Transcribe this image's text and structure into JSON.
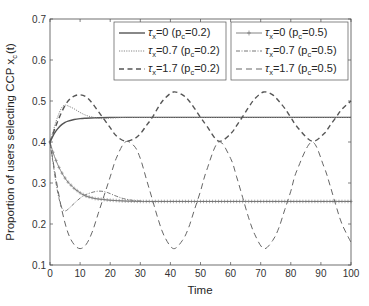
{
  "chart_data": {
    "type": "line",
    "title": "",
    "xlabel": "Time",
    "ylabel": "Proportion of users selecting CCP x",
    "ylabel_subscript": "c",
    "ylabel_suffix": "(t)",
    "xlim": [
      0,
      100
    ],
    "ylim": [
      0.1,
      0.7
    ],
    "x_ticks": [
      0,
      10,
      20,
      30,
      40,
      50,
      60,
      70,
      80,
      90,
      100
    ],
    "y_ticks": [
      0.1,
      0.2,
      0.3,
      0.4,
      0.5,
      0.6,
      0.7
    ],
    "grid": false,
    "legend_position": "top, two boxes (left: p_c=0.2, right: p_c=0.5)",
    "series": [
      {
        "name": "τx=0 (pc=0.2)",
        "style": "solid",
        "x": [
          0,
          1,
          2,
          3,
          4,
          5,
          6,
          8,
          10,
          12,
          15,
          20,
          30,
          50,
          100
        ],
        "values": [
          0.4,
          0.415,
          0.427,
          0.436,
          0.443,
          0.448,
          0.451,
          0.455,
          0.457,
          0.458,
          0.459,
          0.46,
          0.46,
          0.46,
          0.46
        ]
      },
      {
        "name": "τx=0.7 (pc=0.2)",
        "style": "dotted",
        "x": [
          0,
          1,
          2,
          3,
          4,
          5,
          6,
          8,
          10,
          12,
          14,
          17,
          20,
          25,
          30,
          50,
          100
        ],
        "values": [
          0.4,
          0.425,
          0.45,
          0.47,
          0.485,
          0.49,
          0.488,
          0.481,
          0.472,
          0.465,
          0.461,
          0.457,
          0.458,
          0.46,
          0.46,
          0.46,
          0.46
        ]
      },
      {
        "name": "τx=1.7 (pc=0.2)",
        "style": "dashed",
        "x": [
          0,
          2,
          4,
          6,
          8,
          10,
          12,
          14,
          16,
          18,
          20,
          22,
          25,
          28,
          30,
          32,
          34,
          36,
          38,
          41,
          44,
          46,
          48,
          50,
          52,
          56,
          60,
          62,
          64,
          66,
          68,
          71,
          74,
          76,
          78,
          80,
          82,
          87,
          91,
          93,
          95,
          97,
          100
        ],
        "values": [
          0.4,
          0.44,
          0.475,
          0.5,
          0.512,
          0.515,
          0.51,
          0.495,
          0.475,
          0.455,
          0.435,
          0.415,
          0.402,
          0.408,
          0.42,
          0.44,
          0.46,
          0.485,
          0.505,
          0.522,
          0.515,
          0.502,
          0.482,
          0.46,
          0.44,
          0.402,
          0.42,
          0.44,
          0.462,
          0.485,
          0.505,
          0.522,
          0.515,
          0.5,
          0.482,
          0.46,
          0.438,
          0.402,
          0.42,
          0.44,
          0.46,
          0.48,
          0.5
        ]
      },
      {
        "name": "τx=0 (pc=0.5)",
        "style": "solid with plus markers",
        "x": [
          0,
          1,
          2,
          3,
          4,
          5,
          6,
          8,
          10,
          12,
          15,
          20,
          25,
          30,
          40,
          100
        ],
        "values": [
          0.4,
          0.375,
          0.355,
          0.338,
          0.324,
          0.312,
          0.302,
          0.287,
          0.276,
          0.268,
          0.262,
          0.258,
          0.256,
          0.255,
          0.255,
          0.255
        ]
      },
      {
        "name": "τx=0.7 (pc=0.5)",
        "style": "dash-dot",
        "x": [
          0,
          1,
          2,
          3,
          4,
          5,
          6,
          8,
          10,
          12,
          15,
          17,
          19,
          22,
          25,
          30,
          40,
          100
        ],
        "values": [
          0.4,
          0.35,
          0.3,
          0.262,
          0.238,
          0.232,
          0.236,
          0.25,
          0.263,
          0.272,
          0.279,
          0.28,
          0.277,
          0.268,
          0.261,
          0.256,
          0.255,
          0.255
        ]
      },
      {
        "name": "τx=1.7 (pc=0.5)",
        "style": "long dashed",
        "x": [
          0,
          2,
          4,
          6,
          8,
          10,
          12,
          14,
          16,
          18,
          20,
          22,
          25,
          28,
          30,
          32,
          34,
          36,
          38,
          41,
          44,
          46,
          48,
          50,
          52,
          56,
          60,
          62,
          64,
          66,
          68,
          71,
          74,
          76,
          78,
          80,
          82,
          87,
          91,
          93,
          95,
          97,
          100
        ],
        "values": [
          0.4,
          0.31,
          0.232,
          0.178,
          0.15,
          0.14,
          0.15,
          0.18,
          0.225,
          0.27,
          0.315,
          0.36,
          0.4,
          0.39,
          0.36,
          0.31,
          0.26,
          0.21,
          0.17,
          0.14,
          0.16,
          0.19,
          0.235,
          0.28,
          0.33,
          0.4,
          0.36,
          0.315,
          0.265,
          0.215,
          0.175,
          0.14,
          0.16,
          0.19,
          0.235,
          0.28,
          0.33,
          0.4,
          0.34,
          0.295,
          0.245,
          0.2,
          0.155
        ]
      }
    ]
  },
  "legend": {
    "left": [
      {
        "tau_prefix": "τ",
        "tau_sub": "x",
        "tau_val": "=0 (p",
        "pc_sub": "c",
        "pc_val": "=0.2)"
      },
      {
        "tau_prefix": "τ",
        "tau_sub": "x",
        "tau_val": "=0.7 (p",
        "pc_sub": "c",
        "pc_val": "=0.2)"
      },
      {
        "tau_prefix": "τ",
        "tau_sub": "x",
        "tau_val": "=1.7 (p",
        "pc_sub": "c",
        "pc_val": "=0.2)"
      }
    ],
    "right": [
      {
        "tau_prefix": "τ",
        "tau_sub": "x",
        "tau_val": "=0 (p",
        "pc_sub": "c",
        "pc_val": "=0.5)"
      },
      {
        "tau_prefix": "τ",
        "tau_sub": "x",
        "tau_val": "=0.7 (p",
        "pc_sub": "c",
        "pc_val": "=0.5)"
      },
      {
        "tau_prefix": "τ",
        "tau_sub": "x",
        "tau_val": "=1.7 (p",
        "pc_sub": "c",
        "pc_val": "=0.5)"
      }
    ]
  },
  "colors": {
    "axis": "#4d4d4d",
    "line_dark": "#555555",
    "line_mid": "#666666",
    "line_light": "#888888",
    "text": "#262626"
  }
}
